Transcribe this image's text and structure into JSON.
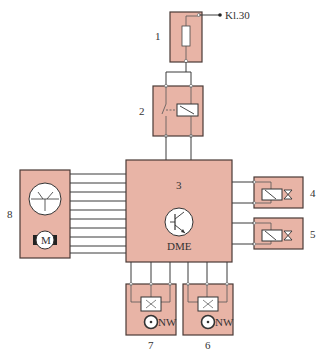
{
  "diagram": {
    "type": "electrical circuit schematic",
    "components": [
      {
        "id": "1",
        "label": "1",
        "symbol": "fuse"
      },
      {
        "id": "2",
        "label": "2",
        "symbol": "relay"
      },
      {
        "id": "3",
        "label": "3",
        "symbol": "control-unit",
        "name": "DME"
      },
      {
        "id": "4",
        "label": "4",
        "symbol": "solenoid-valve"
      },
      {
        "id": "5",
        "label": "5",
        "symbol": "solenoid-valve"
      },
      {
        "id": "6",
        "label": "6",
        "symbol": "camshaft-sensor",
        "sensor_label": "NW"
      },
      {
        "id": "7",
        "label": "7",
        "symbol": "camshaft-sensor",
        "sensor_label": "NW"
      },
      {
        "id": "8",
        "label": "8",
        "symbol": "throttle-actuator-motor",
        "motor_label": "M"
      }
    ],
    "terminal": "Kl.30",
    "dme_label": "DME",
    "sensor_label": "NW",
    "motor_label": "M",
    "colors": {
      "box_fill": "#e8b4a6",
      "box_stroke": "#4a3a36",
      "wire": "#3a3a3a",
      "background": "#ffffff"
    }
  }
}
